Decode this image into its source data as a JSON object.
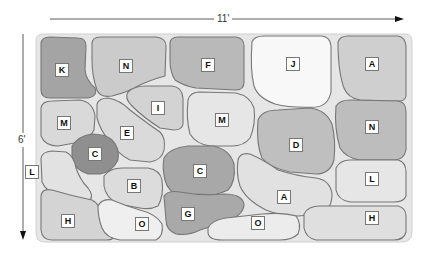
{
  "dimensions": {
    "width_label": "11'",
    "height_label": "6'"
  },
  "colors": {
    "background": "#ffffff",
    "grout": "#e4e4e4",
    "outline": "#7a7a7a",
    "shade_dark": "#9a9a9a",
    "shade_mid": "#b8b8b8",
    "shade_light": "#d2d2d2",
    "shade_lighter": "#e0e0e0",
    "shade_white": "#f7f7f7"
  },
  "stones": [
    {
      "label": "K",
      "x": 62,
      "y": 70,
      "shade": "#a4a4a4"
    },
    {
      "label": "N",
      "x": 126,
      "y": 66,
      "shade": "#cbcbcb"
    },
    {
      "label": "F",
      "x": 208,
      "y": 65,
      "shade": "#b9b9b9"
    },
    {
      "label": "J",
      "x": 293,
      "y": 64,
      "shade": "#f8f8f8"
    },
    {
      "label": "A",
      "x": 372,
      "y": 64,
      "shade": "#cfcfcf"
    },
    {
      "label": "M",
      "x": 64,
      "y": 123,
      "shade": "#d9d9d9"
    },
    {
      "label": "I",
      "x": 158,
      "y": 108,
      "shade": "#d3d3d3"
    },
    {
      "label": "E",
      "x": 127,
      "y": 133,
      "shade": "#dadada"
    },
    {
      "label": "M",
      "x": 222,
      "y": 120,
      "shade": "#e6e6e6"
    },
    {
      "label": "D",
      "x": 296,
      "y": 145,
      "shade": "#bfbfbf"
    },
    {
      "label": "N",
      "x": 372,
      "y": 127,
      "shade": "#bdbdbd"
    },
    {
      "label": "C",
      "x": 95,
      "y": 154,
      "shade": "#8f8f8f"
    },
    {
      "label": "C",
      "x": 200,
      "y": 171,
      "shade": "#a8a8a8"
    },
    {
      "label": "L",
      "x": 32,
      "y": 172,
      "shade": "#e2e2e2"
    },
    {
      "label": "B",
      "x": 134,
      "y": 186,
      "shade": "#dcdcdc"
    },
    {
      "label": "A",
      "x": 284,
      "y": 197,
      "shade": "#e1e1e1"
    },
    {
      "label": "L",
      "x": 372,
      "y": 179,
      "shade": "#e6e6e6"
    },
    {
      "label": "G",
      "x": 188,
      "y": 214,
      "shade": "#a9a9a9"
    },
    {
      "label": "H",
      "x": 68,
      "y": 221,
      "shade": "#d4d4d4"
    },
    {
      "label": "O",
      "x": 142,
      "y": 224,
      "shade": "#efefef"
    },
    {
      "label": "O",
      "x": 258,
      "y": 223,
      "shade": "#ececec"
    },
    {
      "label": "H",
      "x": 372,
      "y": 218,
      "shade": "#dfdfdf"
    }
  ]
}
